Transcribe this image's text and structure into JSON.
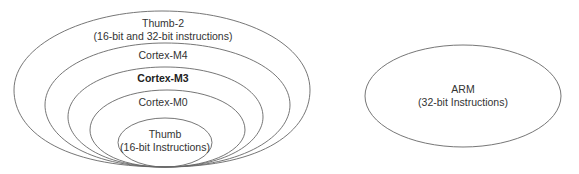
{
  "diagram": {
    "nested_sets": [
      {
        "id": "thumb2",
        "title": "Thumb-2",
        "subtitle": "(16-bit and 32-bit instructions)",
        "bold": false
      },
      {
        "id": "cortex-m4",
        "title": "Cortex-M4",
        "bold": false
      },
      {
        "id": "cortex-m3",
        "title": "Cortex-M3",
        "bold": true
      },
      {
        "id": "cortex-m0",
        "title": "Cortex-M0",
        "bold": false
      },
      {
        "id": "thumb",
        "title": "Thumb",
        "subtitle": "(16-bit Instructions)",
        "bold": false
      }
    ],
    "separate_set": {
      "id": "arm",
      "title": "ARM",
      "subtitle": "(32-bit Instructions)"
    },
    "colors": {
      "stroke": "#555555",
      "text": "#333333",
      "background": "#ffffff"
    }
  }
}
